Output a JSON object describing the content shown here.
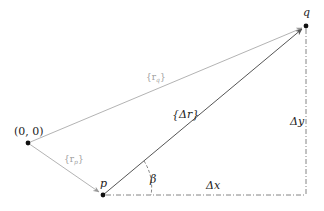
{
  "diagram": {
    "points": {
      "origin": {
        "label": "(0, 0)",
        "x": 28,
        "y": 143
      },
      "p": {
        "label": "p",
        "x": 103,
        "y": 195
      },
      "q": {
        "label": "q",
        "x": 306,
        "y": 26
      },
      "corner": {
        "x": 306,
        "y": 195
      }
    },
    "vectors": {
      "r_q": {
        "label": "{r_q}",
        "display_main": "{r",
        "display_sub": "q",
        "display_close": "}"
      },
      "r_p": {
        "label": "{r_p}",
        "display_main": "{r",
        "display_sub": "p",
        "display_close": "}"
      },
      "delta_r": {
        "label": "{Δr}",
        "display": "{Δr}"
      }
    },
    "labels": {
      "delta_x": "Δx",
      "delta_y": "Δy",
      "beta": "β"
    },
    "colors": {
      "primary_line": "#555555",
      "grey_line": "#aaaaaa",
      "grey_text": "#a0a0a0",
      "point": "#111111",
      "dashed": "#666666"
    }
  }
}
